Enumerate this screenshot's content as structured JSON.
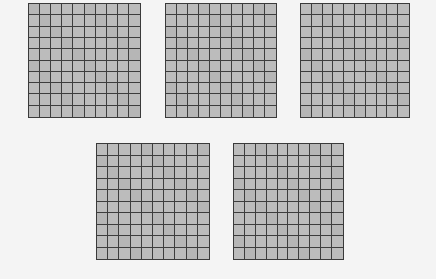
{
  "figure": {
    "background_color": "#f4f4f4",
    "cell_color": "#bcbcbc",
    "line_color": "#3d3d3d",
    "grids": [
      {
        "id": "grid-1",
        "rows": 10,
        "cols": 10,
        "x": 28,
        "y": 3,
        "w": 113,
        "h": 115
      },
      {
        "id": "grid-2",
        "rows": 10,
        "cols": 10,
        "x": 165,
        "y": 3,
        "w": 112,
        "h": 115
      },
      {
        "id": "grid-3",
        "rows": 10,
        "cols": 10,
        "x": 300,
        "y": 3,
        "w": 110,
        "h": 115
      },
      {
        "id": "grid-4",
        "rows": 10,
        "cols": 10,
        "x": 96,
        "y": 143,
        "w": 114,
        "h": 117
      },
      {
        "id": "grid-5",
        "rows": 10,
        "cols": 10,
        "x": 233,
        "y": 143,
        "w": 111,
        "h": 117
      }
    ]
  }
}
